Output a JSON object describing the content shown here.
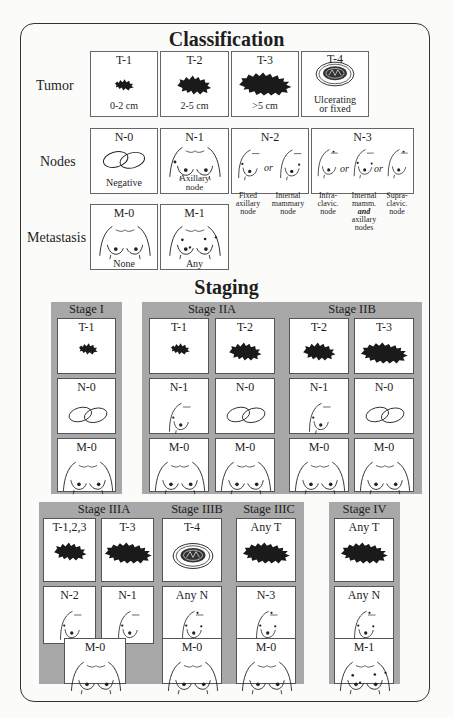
{
  "classification": {
    "title": "Classification",
    "rows": {
      "tumor": "Tumor",
      "nodes": "Nodes",
      "metastasis": "Metastasis"
    },
    "tumor": [
      {
        "label": "T-1",
        "caption": "0-2 cm",
        "icon": "tumor-small-icon"
      },
      {
        "label": "T-2",
        "caption": "2-5 cm",
        "icon": "tumor-medium-icon"
      },
      {
        "label": "T-3",
        "caption": ">5 cm",
        "icon": "tumor-large-icon"
      },
      {
        "label": "T-4",
        "caption_line1": "Ulcerating",
        "caption_line2": "or fixed",
        "icon": "tumor-ulcerating-icon"
      }
    ],
    "nodes": [
      {
        "label": "N-0",
        "caption": "Negative",
        "icon": "negative-nodes-icon"
      },
      {
        "label": "N-1",
        "caption_line1": "Axillary",
        "caption_line2": "node",
        "icon": "axillary-node-icon"
      },
      {
        "label": "N-2",
        "or": "or",
        "sub": [
          {
            "lines": [
              "Fixed",
              "axillary",
              "node"
            ]
          },
          {
            "lines": [
              "Internal",
              "mammary",
              "node"
            ]
          }
        ]
      },
      {
        "label": "N-3",
        "or1": "or",
        "or2": "or",
        "sub": [
          {
            "lines": [
              "Infra-",
              "clavic.",
              "node"
            ]
          },
          {
            "lines": [
              "Internal",
              "mamm.",
              "and",
              "axillary",
              "nodes"
            ]
          },
          {
            "lines": [
              "Supra-",
              "clavic.",
              "node"
            ]
          }
        ]
      }
    ],
    "metastasis": [
      {
        "label": "M-0",
        "caption": "None"
      },
      {
        "label": "M-1",
        "caption": "Any"
      }
    ]
  },
  "staging": {
    "title": "Staging",
    "stages": [
      {
        "name": "Stage I",
        "columns": [
          {
            "T": "T-1",
            "N": "N-0",
            "M": "M-0"
          }
        ]
      },
      {
        "name": "Stage IIA",
        "columns": [
          {
            "T": "T-1",
            "N": "N-1",
            "M": "M-0"
          },
          {
            "T": "T-2",
            "N": "N-0",
            "M": "M-0"
          }
        ]
      },
      {
        "name": "Stage IIB",
        "columns": [
          {
            "T": "T-2",
            "N": "N-1",
            "M": "M-0"
          },
          {
            "T": "T-3",
            "N": "N-0",
            "M": "M-0"
          }
        ]
      },
      {
        "name": "Stage IIIA",
        "columns": [
          {
            "T": "T-1,2,3",
            "N": "N-2"
          },
          {
            "T": "T-3",
            "N": "N-1"
          }
        ],
        "M": "M-0"
      },
      {
        "name": "Stage IIIB",
        "columns": [
          {
            "T": "T-4",
            "N": "Any N",
            "M": "M-0"
          }
        ]
      },
      {
        "name": "Stage IIIC",
        "columns": [
          {
            "T": "Any T",
            "N": "N-3",
            "M": "M-0"
          }
        ]
      },
      {
        "name": "Stage IV",
        "columns": [
          {
            "T": "Any T",
            "N": "Any N",
            "M": "M-1"
          }
        ]
      }
    ]
  },
  "colors": {
    "panel_gray": "#a8a8a8",
    "box_white": "#ffffff",
    "ink": "#1e1e1e"
  }
}
